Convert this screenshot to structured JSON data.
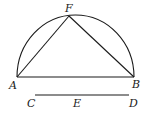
{
  "diagram": {
    "type": "geometry-figure",
    "stroke_color": "#1a1a1a",
    "points": {
      "A": {
        "label": "A",
        "x": 17,
        "y": 77
      },
      "B": {
        "label": "B",
        "x": 134,
        "y": 77
      },
      "F": {
        "label": "F",
        "x": 69,
        "y": 16
      },
      "C": {
        "label": "C",
        "x": 35,
        "y": 95
      },
      "E": {
        "label": "E",
        "x": 80,
        "y": 95
      },
      "D": {
        "label": "D",
        "x": 129,
        "y": 95
      }
    },
    "labels": {
      "A": "A",
      "B": "B",
      "F": "F",
      "C": "C",
      "E": "E",
      "D": "D"
    },
    "segments": [
      {
        "from": "A",
        "to": "B"
      },
      {
        "from": "A",
        "to": "F"
      },
      {
        "from": "F",
        "to": "B"
      },
      {
        "from": "C",
        "to": "D"
      }
    ],
    "arcs": [
      {
        "from": "A",
        "to": "B",
        "through": "F",
        "kind": "semicircle"
      }
    ]
  }
}
